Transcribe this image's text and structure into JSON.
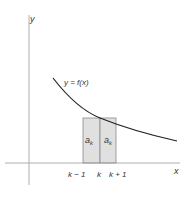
{
  "diagram": {
    "axes": {
      "x_label": "x",
      "y_label": "y"
    },
    "curve_label": "y = f(x)",
    "rect_labels": {
      "left": "a",
      "left_sub": "k",
      "right": "a",
      "right_sub": "k"
    },
    "ticks": {
      "left": "k − 1",
      "mid": "k",
      "right": "k + 1"
    },
    "colors": {
      "rect_fill": "#e0e0e0",
      "rect_stroke": "#8a8a8a",
      "curve": "#222222",
      "axis": "#9a9a9a"
    }
  }
}
